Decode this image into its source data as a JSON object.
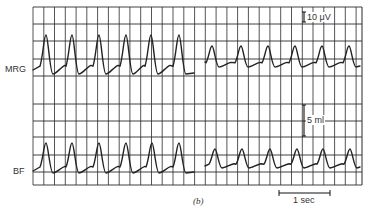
{
  "figure": {
    "caption": "(b)",
    "grid": {
      "left": 33,
      "right": 362,
      "top": 7,
      "bottom": 185,
      "col_spacing": 10.77,
      "row_lines_y": [
        7,
        24,
        41,
        59,
        76,
        104,
        121,
        137,
        155,
        172,
        185
      ],
      "line_color": "#2a2a2a",
      "trace_color": "#222222"
    },
    "scale_bars": {
      "amplitude_mrg": {
        "label": "10 μV",
        "x": 304,
        "y1": 12,
        "y2": 22
      },
      "volume_bf": {
        "label": "5 ml",
        "x": 304,
        "y1": 105,
        "y2": 136
      },
      "time": {
        "label": "1 sec",
        "x1": 279,
        "x2": 330,
        "y": 193
      }
    }
  },
  "chart_data": {
    "type": "line",
    "title": "",
    "caption": "(b)",
    "xlabel": "time",
    "ylabel": "",
    "grid": true,
    "time_scale_bar": "1 sec",
    "traces": [
      {
        "name": "MRG",
        "units_scale": "10 μV",
        "segments": [
          {
            "label": "before",
            "cycles": 6,
            "peaks_px_x": [
              46,
              72,
              99,
              126,
              151,
              179
            ],
            "peak_y_px": 35,
            "trough_y_px": 74,
            "start": [
              33,
              70
            ],
            "end": [
              194,
              73
            ]
          },
          {
            "label": "after",
            "cycles": 6,
            "peaks_px_x": [
              212,
              241,
              268,
              295,
              322,
              349
            ],
            "peak_y_px": 46,
            "trough_y_px": 67,
            "start": [
              205,
              62
            ],
            "end": [
              360,
              66
            ]
          }
        ]
      },
      {
        "name": "BF",
        "units_scale": "5 ml",
        "segments": [
          {
            "label": "before",
            "cycles": 6,
            "peaks_px_x": [
              46,
              72,
              99,
              126,
              152,
              179
            ],
            "peak_y_px": 143,
            "trough_y_px": 173,
            "start": [
              33,
              171
            ],
            "end": [
              194,
              172
            ]
          },
          {
            "label": "after",
            "cycles": 6,
            "peaks_px_x": [
              215,
              242,
              270,
              297,
              323,
              350
            ],
            "peak_y_px": 149,
            "trough_y_px": 168,
            "start": [
              205,
              166
            ],
            "end": [
              360,
              167
            ]
          }
        ]
      }
    ]
  }
}
